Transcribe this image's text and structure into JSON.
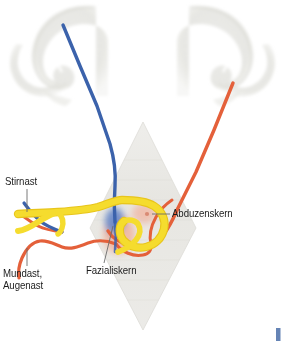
{
  "figure": {
    "width": 285,
    "height": 341,
    "background": "#ffffff"
  },
  "labels": {
    "stirnast": "Stirnast",
    "mundast": "Mundast,",
    "augenast": "Augenast",
    "fazialiskern": "Fazialiskern",
    "abduzenskern": "Abduzenskern"
  },
  "colors": {
    "blue_tract": "#3b62ab",
    "orange_tract": "#e4603a",
    "facial_nerve_yellow": "#f5dc2e",
    "yellow_shadow": "#e8c51c",
    "nucleus_blue": "#5b7fc4",
    "nucleus_pink": "#f2b39c",
    "abducens_pink": "#f0b6a4",
    "brainstem_gray": "#e6e5e1",
    "hemisphere_gray": "#e3e3de",
    "leader_line": "#6b6b6b",
    "label_text": "#1b1b1b",
    "corner_mark": "#4a6ea8"
  },
  "structures": {
    "left_hemisphere": "cerebral-hemisphere-cross-section-left",
    "right_hemisphere": "cerebral-hemisphere-cross-section-right",
    "brainstem": "rhomboid-fossa-brainstem-outline",
    "blue_pathway": "corticobulbar-tract-blue",
    "orange_pathway": "corticobulbar-tract-orange",
    "yellow_pathway": "facial-nerve-genu-yellow",
    "facial_nucleus": "facial-nucleus",
    "abducens_nucleus": "abducens-nucleus"
  }
}
